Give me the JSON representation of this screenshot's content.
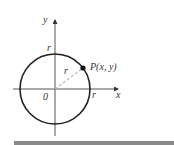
{
  "figure": {
    "type": "circle-on-coordinate-plane",
    "axes": {
      "x_label": "x",
      "y_label": "y",
      "origin_label": "0"
    },
    "circle": {
      "radius_label_top": "r",
      "radius_label_right": "r",
      "radius_label_diagonal": "r"
    },
    "point": {
      "label": "P(x, y)"
    },
    "colors": {
      "stroke": "#222222",
      "axis": "#555555",
      "dashed_radius": "#bbbbbb",
      "text": "#333333",
      "bottom_rule": "#8a8a8a"
    }
  }
}
